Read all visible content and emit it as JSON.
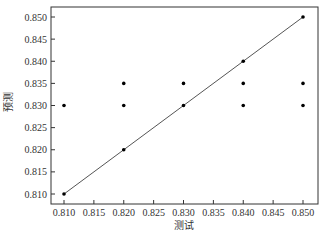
{
  "chart_data": {
    "type": "scatter",
    "title": "",
    "xlabel": "测试",
    "ylabel": "预测",
    "xlim": [
      0.8075,
      0.8515
    ],
    "ylim": [
      0.8075,
      0.8522
    ],
    "x_ticks": [
      "0.810",
      "0.815",
      "0.820",
      "0.825",
      "0.830",
      "0.835",
      "0.840",
      "0.845",
      "0.850"
    ],
    "y_ticks": [
      "0.810",
      "0.815",
      "0.820",
      "0.825",
      "0.830",
      "0.835",
      "0.840",
      "0.845",
      "0.850"
    ],
    "grid": false,
    "legend": null,
    "series": [
      {
        "name": "points",
        "type": "scatter",
        "color": "#000000",
        "points": [
          {
            "x": 0.81,
            "y": 0.83
          },
          {
            "x": 0.81,
            "y": 0.81
          },
          {
            "x": 0.82,
            "y": 0.835
          },
          {
            "x": 0.82,
            "y": 0.83
          },
          {
            "x": 0.82,
            "y": 0.82
          },
          {
            "x": 0.83,
            "y": 0.835
          },
          {
            "x": 0.83,
            "y": 0.83
          },
          {
            "x": 0.84,
            "y": 0.84
          },
          {
            "x": 0.84,
            "y": 0.835
          },
          {
            "x": 0.84,
            "y": 0.83
          },
          {
            "x": 0.85,
            "y": 0.85
          },
          {
            "x": 0.85,
            "y": 0.835
          },
          {
            "x": 0.85,
            "y": 0.83
          }
        ]
      },
      {
        "name": "y=x reference",
        "type": "line",
        "color": "#555555",
        "points": [
          {
            "x": 0.81,
            "y": 0.81
          },
          {
            "x": 0.85,
            "y": 0.85
          }
        ]
      }
    ]
  }
}
